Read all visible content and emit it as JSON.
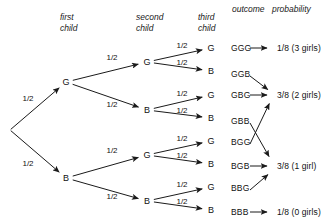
{
  "figure": {
    "type": "probability-tree",
    "background_color": "#ffffff",
    "line_color": "#1a1a1a"
  },
  "headers": [
    {
      "name": "first-child",
      "text": "first\nchild",
      "x": 60,
      "y": 12
    },
    {
      "name": "second-child",
      "text": "second\nchild",
      "x": 136,
      "y": 12
    },
    {
      "name": "third-child",
      "text": "third\nchild",
      "x": 198,
      "y": 12
    },
    {
      "name": "outcome",
      "text": "outcome",
      "x": 232,
      "y": 4
    },
    {
      "name": "probability",
      "text": "probability",
      "x": 272,
      "y": 4
    }
  ],
  "nodes": [
    {
      "id": "root",
      "label": "",
      "x": 10,
      "y": 130
    },
    {
      "id": "g",
      "label": "G",
      "x": 66,
      "y": 82
    },
    {
      "id": "b",
      "label": "B",
      "x": 66,
      "y": 178
    },
    {
      "id": "gg",
      "label": "G",
      "x": 147,
      "y": 62
    },
    {
      "id": "gb",
      "label": "B",
      "x": 147,
      "y": 110
    },
    {
      "id": "bg",
      "label": "G",
      "x": 147,
      "y": 155
    },
    {
      "id": "bb",
      "label": "B",
      "x": 147,
      "y": 201
    },
    {
      "id": "leaf1",
      "label": "G",
      "x": 211,
      "y": 48
    },
    {
      "id": "leaf2",
      "label": "B",
      "x": 211,
      "y": 71
    },
    {
      "id": "leaf3",
      "label": "G",
      "x": 211,
      "y": 95
    },
    {
      "id": "leaf4",
      "label": "B",
      "x": 211,
      "y": 118
    },
    {
      "id": "leaf5",
      "label": "G",
      "x": 211,
      "y": 141
    },
    {
      "id": "leaf6",
      "label": "B",
      "x": 211,
      "y": 164
    },
    {
      "id": "leaf7",
      "label": "G",
      "x": 211,
      "y": 187
    },
    {
      "id": "leaf8",
      "label": "B",
      "x": 211,
      "y": 210
    }
  ],
  "branches": [
    {
      "name": "root-to-g",
      "from": "root",
      "to": "g",
      "prob": "1/2",
      "lx": 28,
      "ly": 98
    },
    {
      "name": "root-to-b",
      "from": "root",
      "to": "b",
      "prob": "1/2",
      "lx": 28,
      "ly": 163
    },
    {
      "name": "g-to-gg",
      "from": "g",
      "to": "gg",
      "prob": "1/2",
      "lx": 112,
      "ly": 57
    },
    {
      "name": "g-to-gb",
      "from": "g",
      "to": "gb",
      "prob": "1/2",
      "lx": 112,
      "ly": 104
    },
    {
      "name": "b-to-bg",
      "from": "b",
      "to": "bg",
      "prob": "1/2",
      "lx": 112,
      "ly": 150
    },
    {
      "name": "b-to-bb",
      "from": "b",
      "to": "bb",
      "prob": "1/2",
      "lx": 112,
      "ly": 196
    },
    {
      "name": "gg-to-leaf1",
      "from": "gg",
      "to": "leaf1",
      "prob": "1/2",
      "lx": 182,
      "ly": 45
    },
    {
      "name": "gg-to-leaf2",
      "from": "gg",
      "to": "leaf2",
      "prob": "1/2",
      "lx": 182,
      "ly": 62
    },
    {
      "name": "gb-to-leaf3",
      "from": "gb",
      "to": "leaf3",
      "prob": "1/2",
      "lx": 182,
      "ly": 93
    },
    {
      "name": "gb-to-leaf4",
      "from": "gb",
      "to": "leaf4",
      "prob": "1/2",
      "lx": 182,
      "ly": 110
    },
    {
      "name": "bg-to-leaf5",
      "from": "bg",
      "to": "leaf5",
      "prob": "1/2",
      "lx": 182,
      "ly": 138
    },
    {
      "name": "bg-to-leaf6",
      "from": "bg",
      "to": "leaf6",
      "prob": "1/2",
      "lx": 182,
      "ly": 155
    },
    {
      "name": "bb-to-leaf7",
      "from": "bb",
      "to": "leaf7",
      "prob": "1/2",
      "lx": 182,
      "ly": 184
    },
    {
      "name": "bb-to-leaf8",
      "from": "bb",
      "to": "leaf8",
      "prob": "1/2",
      "lx": 182,
      "ly": 201
    }
  ],
  "outcomes": [
    {
      "id": "o1",
      "text": "GGG",
      "x": 231,
      "y": 48
    },
    {
      "id": "o2",
      "text": "GGB",
      "x": 231,
      "y": 74
    },
    {
      "id": "o3",
      "text": "GBG",
      "x": 231,
      "y": 95
    },
    {
      "id": "o4",
      "text": "GBB",
      "x": 231,
      "y": 121
    },
    {
      "id": "o5",
      "text": "BGG",
      "x": 231,
      "y": 142
    },
    {
      "id": "o6",
      "text": "BGB",
      "x": 231,
      "y": 166
    },
    {
      "id": "o7",
      "text": "BBG",
      "x": 231,
      "y": 188
    },
    {
      "id": "o8",
      "text": "BBB",
      "x": 231,
      "y": 212
    }
  ],
  "probabilities": [
    {
      "id": "p1",
      "text": "1/8 (3 girls)",
      "x": 277,
      "y": 48
    },
    {
      "id": "p2",
      "text": "3/8 (2 girls)",
      "x": 277,
      "y": 95
    },
    {
      "id": "p3",
      "text": "3/8 (1 girl)",
      "x": 277,
      "y": 166
    },
    {
      "id": "p4",
      "text": "1/8 (0 girls)",
      "x": 277,
      "y": 212
    }
  ],
  "outcome_arrows": [
    {
      "name": "ggg-to-p1",
      "x1": 250,
      "y1": 48,
      "x2": 271,
      "y2": 48
    },
    {
      "name": "ggb-to-p2",
      "x1": 250,
      "y1": 76,
      "x2": 271,
      "y2": 92
    },
    {
      "name": "gbg-to-p2",
      "x1": 250,
      "y1": 95,
      "x2": 271,
      "y2": 95
    },
    {
      "name": "gbb-to-p3",
      "x1": 250,
      "y1": 123,
      "x2": 271,
      "y2": 160
    },
    {
      "name": "bgg-to-p2",
      "x1": 250,
      "y1": 144,
      "x2": 271,
      "y2": 100
    },
    {
      "name": "bgb-to-p3",
      "x1": 250,
      "y1": 166,
      "x2": 271,
      "y2": 166
    },
    {
      "name": "bbg-to-p3",
      "x1": 250,
      "y1": 190,
      "x2": 271,
      "y2": 172
    },
    {
      "name": "bbb-to-p4",
      "x1": 250,
      "y1": 212,
      "x2": 271,
      "y2": 212
    }
  ],
  "chart_data": {
    "type": "tree",
    "levels": [
      "first child",
      "second child",
      "third child"
    ],
    "branch_probability": "1/2",
    "outcomes": [
      "GGG",
      "GGB",
      "GBG",
      "GBB",
      "BGG",
      "BGB",
      "BBG",
      "BBB"
    ],
    "grouped_results": [
      {
        "probability": "1/8",
        "description": "3 girls",
        "outcomes": [
          "GGG"
        ]
      },
      {
        "probability": "3/8",
        "description": "2 girls",
        "outcomes": [
          "GGB",
          "GBG",
          "BGG"
        ]
      },
      {
        "probability": "3/8",
        "description": "1 girl",
        "outcomes": [
          "GBB",
          "BGB",
          "BBG"
        ]
      },
      {
        "probability": "1/8",
        "description": "0 girls",
        "outcomes": [
          "BBB"
        ]
      }
    ]
  }
}
